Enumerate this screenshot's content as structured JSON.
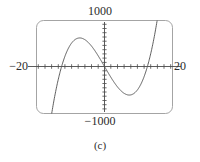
{
  "figure": {
    "caption": "(c)",
    "frame": {
      "x": 36,
      "y": 20,
      "width": 136,
      "height": 93,
      "corner_radius": 7,
      "stroke": "#9a9a9a"
    },
    "curve_color": "#555555",
    "axis_color": "#4a4a4a",
    "text_color": "#2b2b2b"
  },
  "chart_data": {
    "type": "line",
    "title": "",
    "subtitle": "",
    "xlabel": "",
    "ylabel": "",
    "xlim": [
      -20,
      20
    ],
    "ylim": [
      -1000,
      1000
    ],
    "grid": false,
    "legend": null,
    "annotations": [
      "(c)"
    ],
    "axis_tick_labels": {
      "x_left": "−20",
      "x_right": "20",
      "y_top": "1000",
      "y_bottom": "−1000"
    },
    "x_tick_step": 2,
    "y_tick_step": 100,
    "features": {
      "roots": [
        -13.2,
        0,
        13.0
      ],
      "local_max": {
        "x": -7.6,
        "y": 640
      },
      "local_min": {
        "x": 7.2,
        "y": -640
      },
      "enters_bottom_at_x": -15.5,
      "exits_top_at_x": 15.5
    },
    "series": [
      {
        "name": "cubic",
        "x": [
          -16.0,
          -15.5,
          -15.0,
          -14.5,
          -14.0,
          -13.5,
          -13.0,
          -12.5,
          -12.0,
          -11.5,
          -11.0,
          -10.5,
          -10.0,
          -9.5,
          -9.0,
          -8.5,
          -8.0,
          -7.5,
          -7.0,
          -6.5,
          -6.0,
          -5.5,
          -5.0,
          -4.5,
          -4.0,
          -3.5,
          -3.0,
          -2.5,
          -2.0,
          -1.5,
          -1.0,
          -0.5,
          0.0,
          0.5,
          1.0,
          1.5,
          2.0,
          2.5,
          3.0,
          3.5,
          4.0,
          4.5,
          5.0,
          5.5,
          6.0,
          6.5,
          7.0,
          7.5,
          8.0,
          8.5,
          9.0,
          9.5,
          10.0,
          10.5,
          11.0,
          11.5,
          12.0,
          12.5,
          13.0,
          13.5,
          14.0,
          14.5,
          15.0,
          15.5,
          16.0
        ],
        "y": [
          -1317,
          -1091,
          -880,
          -684,
          -504,
          -339,
          -190,
          -56,
          62,
          166,
          255,
          329,
          389,
          434,
          464,
          480,
          482,
          469,
          441,
          400,
          344,
          273,
          189,
          90,
          -22,
          -150,
          -292,
          -449,
          -620,
          -807,
          -1008,
          -1223,
          0,
          0,
          0,
          0,
          0,
          0,
          0,
          0,
          0,
          0,
          0,
          0,
          0,
          0,
          0,
          0,
          0,
          0,
          0,
          0,
          0,
          0,
          0,
          0,
          0,
          0,
          0,
          0,
          0,
          0,
          0,
          0,
          0
        ]
      }
    ],
    "equation_form": "odd cubic: y = a*x^3 + b*x, antisymmetric about origin"
  }
}
